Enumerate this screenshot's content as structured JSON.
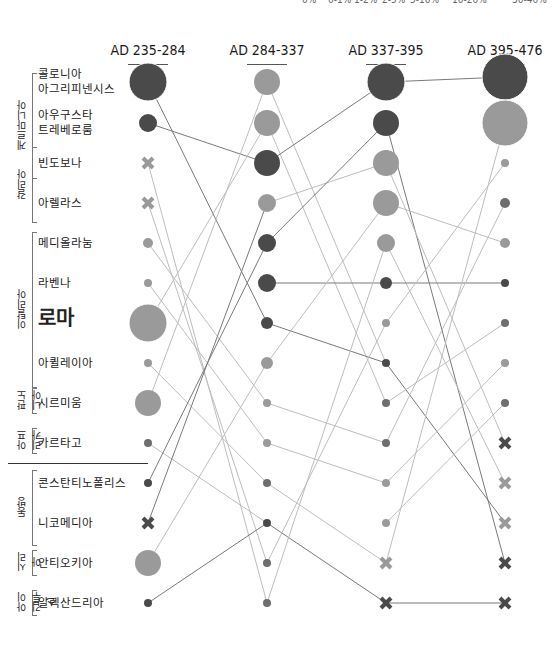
{
  "legend": {
    "items": [
      "0%",
      "0-1%",
      "1-2%",
      "2-5%",
      "5-10%",
      "10-20%",
      "30-40%"
    ]
  },
  "columns": [
    {
      "label": "AD 235-284",
      "x": 148
    },
    {
      "label": "AD 284-337",
      "x": 267
    },
    {
      "label": "AD 337-395",
      "x": 386
    },
    {
      "label": "AD 395-476",
      "x": 505
    }
  ],
  "groups": [
    {
      "label": "게르마니아",
      "top": 73,
      "height": 110
    },
    {
      "label": "갈리아",
      "top": 147,
      "height": 80
    },
    {
      "label": "이탈리아",
      "top": 232,
      "height": 160
    },
    {
      "label": "판노니아",
      "top": 388,
      "height": 30
    },
    {
      "label": "아프리카",
      "top": 428,
      "height": 30
    },
    {
      "label": "동방",
      "top": 470,
      "height": 80
    },
    {
      "label": "시리아",
      "top": 550,
      "height": 30
    },
    {
      "label": "아이깁투스",
      "top": 590,
      "height": 30
    }
  ],
  "cities": [
    {
      "name": "콜로니아\n아그리피넨시스",
      "y": 82
    },
    {
      "name": "아우구스타\n트레베로룸",
      "y": 123
    },
    {
      "name": "빈도보나",
      "y": 163
    },
    {
      "name": "아렐라스",
      "y": 203
    },
    {
      "name": "메디올라눔",
      "y": 243
    },
    {
      "name": "라벤나",
      "y": 283
    },
    {
      "name": "로마",
      "y": 323,
      "big": true
    },
    {
      "name": "아퀼레이아",
      "y": 363
    },
    {
      "name": "시르미움",
      "y": 403
    },
    {
      "name": "카르타고",
      "y": 443
    },
    {
      "name": "콘스탄티노폴리스",
      "y": 483
    },
    {
      "name": "니코메디아",
      "y": 523
    },
    {
      "name": "안티오키아",
      "y": 563
    },
    {
      "name": "알렉산드리아",
      "y": 603
    }
  ],
  "chart_data": {
    "type": "bump/rank",
    "title": "",
    "colors": {
      "dark": "#4a4a4a",
      "mid": "#6e6e6e",
      "light": "#9a9a9a",
      "line": "#bdbdbd",
      "line_dark": "#7a7a7a"
    },
    "periods": [
      "AD 235-284",
      "AD 284-337",
      "AD 337-395",
      "AD 395-476"
    ],
    "nodes": [
      [
        {
          "city": "콜로니아 아그리피넨시스",
          "r": 19,
          "shade": "dark"
        },
        {
          "city": "아우구스타 트레베로룸",
          "r": 9,
          "shade": "dark"
        },
        {
          "city": "빈도보나",
          "r": 0,
          "shade": "light",
          "cross": true
        },
        {
          "city": "아렐라스",
          "r": 0,
          "shade": "light",
          "cross": true
        },
        {
          "city": "메디올라눔",
          "r": 5,
          "shade": "light"
        },
        {
          "city": "라벤나",
          "r": 4,
          "shade": "light"
        },
        {
          "city": "로마",
          "r": 19,
          "shade": "light"
        },
        {
          "city": "아퀼레이아",
          "r": 4,
          "shade": "light"
        },
        {
          "city": "시르미움",
          "r": 13,
          "shade": "light"
        },
        {
          "city": "카르타고",
          "r": 4,
          "shade": "mid"
        },
        {
          "city": "콘스탄티노폴리스",
          "r": 4,
          "shade": "dark"
        },
        {
          "city": "니코메디아",
          "r": 0,
          "shade": "dark",
          "cross": true
        },
        {
          "city": "안티오키아",
          "r": 13,
          "shade": "light"
        },
        {
          "city": "알렉산드리아",
          "r": 4,
          "shade": "dark"
        }
      ],
      [
        {
          "city": "col2-1",
          "r": 13,
          "shade": "light"
        },
        {
          "city": "col2-2",
          "r": 13,
          "shade": "light"
        },
        {
          "city": "col2-3",
          "r": 13,
          "shade": "dark"
        },
        {
          "city": "col2-4",
          "r": 9,
          "shade": "light"
        },
        {
          "city": "col2-5",
          "r": 9,
          "shade": "dark"
        },
        {
          "city": "col2-6",
          "r": 9,
          "shade": "dark"
        },
        {
          "city": "col2-7",
          "r": 6,
          "shade": "dark"
        },
        {
          "city": "col2-8",
          "r": 6,
          "shade": "light"
        },
        {
          "city": "col2-9",
          "r": 4,
          "shade": "light"
        },
        {
          "city": "col2-10",
          "r": 4,
          "shade": "light"
        },
        {
          "city": "col2-11",
          "r": 4,
          "shade": "mid"
        },
        {
          "city": "col2-12",
          "r": 4,
          "shade": "dark"
        },
        {
          "city": "col2-13",
          "r": 4,
          "shade": "mid"
        },
        {
          "city": "col2-14",
          "r": 4,
          "shade": "mid"
        }
      ],
      [
        {
          "city": "col3-1",
          "r": 19,
          "shade": "dark"
        },
        {
          "city": "col3-2",
          "r": 13,
          "shade": "dark"
        },
        {
          "city": "col3-3",
          "r": 13,
          "shade": "light"
        },
        {
          "city": "col3-4",
          "r": 13,
          "shade": "light"
        },
        {
          "city": "col3-5",
          "r": 9,
          "shade": "light"
        },
        {
          "city": "col3-6",
          "r": 6,
          "shade": "dark"
        },
        {
          "city": "col3-7",
          "r": 4,
          "shade": "light"
        },
        {
          "city": "col3-8",
          "r": 4,
          "shade": "dark"
        },
        {
          "city": "col3-9",
          "r": 4,
          "shade": "mid"
        },
        {
          "city": "col3-10",
          "r": 4,
          "shade": "mid"
        },
        {
          "city": "col3-11",
          "r": 4,
          "shade": "light"
        },
        {
          "city": "col3-12",
          "r": 4,
          "shade": "light"
        },
        {
          "city": "col3-13",
          "r": 0,
          "shade": "light",
          "cross": true
        },
        {
          "city": "col3-14",
          "r": 0,
          "shade": "dark",
          "cross": true
        }
      ],
      [
        {
          "city": "col4-1",
          "r": 23,
          "shade": "dark"
        },
        {
          "city": "col4-2",
          "r": 23,
          "shade": "light"
        },
        {
          "city": "col4-3",
          "r": 4,
          "shade": "light"
        },
        {
          "city": "col4-4",
          "r": 5,
          "shade": "mid"
        },
        {
          "city": "col4-5",
          "r": 5,
          "shade": "light"
        },
        {
          "city": "col4-6",
          "r": 4,
          "shade": "dark"
        },
        {
          "city": "col4-7",
          "r": 4,
          "shade": "mid"
        },
        {
          "city": "col4-8",
          "r": 4,
          "shade": "light"
        },
        {
          "city": "col4-9",
          "r": 4,
          "shade": "mid"
        },
        {
          "city": "col4-10",
          "r": 0,
          "shade": "dark",
          "cross": true
        },
        {
          "city": "col4-11",
          "r": 0,
          "shade": "light",
          "cross": true
        },
        {
          "city": "col4-12",
          "r": 0,
          "shade": "light",
          "cross": true
        },
        {
          "city": "col4-13",
          "r": 0,
          "shade": "dark",
          "cross": true
        },
        {
          "city": "col4-14",
          "r": 0,
          "shade": "dark",
          "cross": true
        }
      ]
    ],
    "row_y": [
      82,
      123,
      163,
      203,
      243,
      283,
      323,
      363,
      403,
      443,
      483,
      523,
      563,
      603
    ],
    "col_4_y": [
      82,
      123,
      163,
      203,
      243,
      283,
      323,
      363,
      403,
      443,
      483,
      523,
      563,
      603
    ],
    "links": [
      [
        [
          0,
          0,
          1,
          6
        ],
        [
          0,
          1,
          1,
          2
        ],
        [
          0,
          2,
          1,
          13
        ],
        [
          0,
          3,
          1,
          12
        ],
        [
          0,
          4,
          1,
          8
        ],
        [
          0,
          5,
          1,
          9
        ],
        [
          0,
          6,
          1,
          1
        ],
        [
          0,
          7,
          1,
          10
        ],
        [
          0,
          8,
          1,
          0
        ],
        [
          0,
          9,
          1,
          11
        ],
        [
          0,
          10,
          1,
          4
        ],
        [
          0,
          11,
          1,
          3
        ],
        [
          0,
          12,
          1,
          7
        ],
        [
          0,
          13,
          1,
          11
        ]
      ],
      [
        [
          1,
          0,
          2,
          7
        ],
        [
          1,
          1,
          2,
          8
        ],
        [
          1,
          2,
          2,
          0
        ],
        [
          1,
          3,
          2,
          2
        ],
        [
          1,
          4,
          2,
          1
        ],
        [
          1,
          5,
          2,
          5
        ],
        [
          1,
          6,
          2,
          7
        ],
        [
          1,
          7,
          2,
          3
        ],
        [
          1,
          8,
          2,
          9
        ],
        [
          1,
          9,
          2,
          10
        ],
        [
          1,
          10,
          2,
          12
        ],
        [
          1,
          11,
          2,
          13
        ],
        [
          1,
          12,
          2,
          6
        ],
        [
          1,
          13,
          2,
          4
        ]
      ],
      [
        [
          2,
          0,
          3,
          0
        ],
        [
          2,
          1,
          3,
          12
        ],
        [
          2,
          2,
          3,
          9
        ],
        [
          2,
          3,
          3,
          4
        ],
        [
          2,
          4,
          3,
          10
        ],
        [
          2,
          5,
          3,
          5
        ],
        [
          2,
          6,
          3,
          2
        ],
        [
          2,
          7,
          3,
          11
        ],
        [
          2,
          8,
          3,
          6
        ],
        [
          2,
          9,
          3,
          3
        ],
        [
          2,
          10,
          3,
          7
        ],
        [
          2,
          11,
          3,
          8
        ],
        [
          2,
          12,
          3,
          1
        ],
        [
          2,
          13,
          3,
          13
        ]
      ]
    ]
  }
}
